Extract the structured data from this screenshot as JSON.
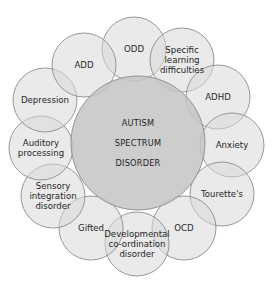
{
  "diagram": {
    "type": "hub-and-ring overlapping circles",
    "center": {
      "lines": [
        "AUTISM",
        "SPECTRUM",
        "DISORDER"
      ],
      "cx": 138,
      "cy": 143,
      "r": 67,
      "fill": "#c4c4c4"
    },
    "ring": {
      "circle_radius": 32,
      "fill": "#d9d9d9",
      "stroke": "#8c8c8c",
      "nodes": [
        {
          "id": "odd",
          "lines": [
            "ODD"
          ],
          "cx": 134,
          "cy": 49
        },
        {
          "id": "specific-learning-difficulties",
          "lines": [
            "Specific",
            "learning",
            "difficulties"
          ],
          "cx": 182,
          "cy": 60
        },
        {
          "id": "adhd",
          "lines": [
            "ADHD"
          ],
          "cx": 218,
          "cy": 97
        },
        {
          "id": "anxiety",
          "lines": [
            "Anxiety"
          ],
          "cx": 232,
          "cy": 145
        },
        {
          "id": "tourettes",
          "lines": [
            "Tourette's"
          ],
          "cx": 222,
          "cy": 194
        },
        {
          "id": "ocd",
          "lines": [
            "OCD"
          ],
          "cx": 184,
          "cy": 228
        },
        {
          "id": "developmental-coordination-disorder",
          "lines": [
            "Developmental",
            "co-ordination",
            "disorder"
          ],
          "cx": 137,
          "cy": 244
        },
        {
          "id": "gifted",
          "lines": [
            "Gifted"
          ],
          "cx": 91,
          "cy": 228
        },
        {
          "id": "sensory-integration-disorder",
          "lines": [
            "Sensory",
            "integration",
            "disorder"
          ],
          "cx": 53,
          "cy": 196
        },
        {
          "id": "auditory-processing",
          "lines": [
            "Auditory",
            "processing"
          ],
          "cx": 41,
          "cy": 148
        },
        {
          "id": "depression",
          "lines": [
            "Depression"
          ],
          "cx": 45,
          "cy": 100
        },
        {
          "id": "add",
          "lines": [
            "ADD"
          ],
          "cx": 84,
          "cy": 65
        }
      ]
    }
  }
}
